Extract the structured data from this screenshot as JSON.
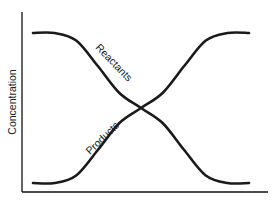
{
  "chart_data": {
    "type": "line",
    "title": "",
    "xlabel": "",
    "ylabel": "Concentration",
    "xlim": [
      0,
      10
    ],
    "ylim": [
      0,
      1
    ],
    "grid": false,
    "legend": "none",
    "x": [
      0,
      1,
      2,
      3,
      4,
      5,
      6,
      7,
      8,
      9,
      10
    ],
    "series": [
      {
        "name": "Reactants",
        "values": [
          1.0,
          1.0,
          0.95,
          0.78,
          0.6,
          0.5,
          0.4,
          0.22,
          0.05,
          0.0,
          0.0
        ]
      },
      {
        "name": "Products",
        "values": [
          0.0,
          0.0,
          0.05,
          0.22,
          0.4,
          0.5,
          0.6,
          0.78,
          0.95,
          1.0,
          1.0
        ]
      }
    ],
    "annotations": [
      "Reactants",
      "Products"
    ]
  }
}
